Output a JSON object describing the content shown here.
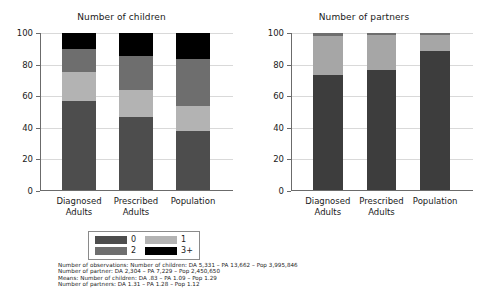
{
  "chart_data": [
    {
      "type": "bar",
      "stacked": true,
      "title": "Number of children",
      "xlabel": "",
      "ylabel": "",
      "ylim": [
        0,
        100
      ],
      "yticks": [
        0,
        20,
        40,
        60,
        80,
        100
      ],
      "grid": true,
      "legend_position": "bottom",
      "categories": [
        "Diagnosed Adults",
        "Prescribed Adults",
        "Population"
      ],
      "category_lines": [
        [
          "Diagnosed",
          "Adults"
        ],
        [
          "Prescribed",
          "Adults"
        ],
        [
          "Population",
          ""
        ]
      ],
      "series": [
        {
          "name": "0",
          "color": "#4d4d4d",
          "values": [
            56.5,
            46.5,
            37.5
          ]
        },
        {
          "name": "1",
          "color": "#b3b3b3",
          "values": [
            18.5,
            17.0,
            16.0
          ]
        },
        {
          "name": "2",
          "color": "#6e6e6e",
          "values": [
            15.0,
            22.0,
            30.0
          ]
        },
        {
          "name": "3+",
          "color": "#000000",
          "values": [
            10.0,
            14.5,
            16.5
          ]
        }
      ]
    },
    {
      "type": "bar",
      "stacked": true,
      "title": "Number of partners",
      "xlabel": "",
      "ylabel": "",
      "ylim": [
        0,
        100
      ],
      "yticks": [
        0,
        20,
        40,
        60,
        80,
        100
      ],
      "grid": true,
      "legend_position": "bottom",
      "categories": [
        "Diagnosed Adults",
        "Prescribed Adults",
        "Population"
      ],
      "category_lines": [
        [
          "Diagnosed",
          "Adults"
        ],
        [
          "Prescribed",
          "Adults"
        ],
        [
          "Population",
          ""
        ]
      ],
      "series": [
        {
          "name": "1",
          "color": "#3d3d3d",
          "values": [
            73.5,
            76.5,
            88.5
          ]
        },
        {
          "name": "2",
          "color": "#a6a6a6",
          "values": [
            24.5,
            22.0,
            10.5
          ]
        },
        {
          "name": "3+",
          "color": "#6e6e6e",
          "values": [
            2.0,
            1.5,
            1.0
          ]
        }
      ]
    }
  ],
  "left_chart": {
    "title": "Number of children",
    "yticks": [
      "100",
      "80",
      "60",
      "40",
      "20",
      "0"
    ],
    "xticks": [
      {
        "line1": "Diagnosed",
        "line2": "Adults"
      },
      {
        "line1": "Prescribed",
        "line2": "Adults"
      },
      {
        "line1": "Population",
        "line2": ""
      }
    ],
    "legend": [
      {
        "label": "0",
        "color": "#4d4d4d"
      },
      {
        "label": "1",
        "color": "#b3b3b3"
      },
      {
        "label": "2",
        "color": "#6e6e6e"
      },
      {
        "label": "3+",
        "color": "#000000"
      }
    ]
  },
  "right_chart": {
    "title": "Number of partners",
    "yticks": [
      "100",
      "80",
      "60",
      "40",
      "20",
      "0"
    ],
    "xticks": [
      {
        "line1": "Diagnosed",
        "line2": "Adults"
      },
      {
        "line1": "Prescribed",
        "line2": "Adults"
      },
      {
        "line1": "Population",
        "line2": ""
      }
    ],
    "legend": [
      {
        "label": "1",
        "color": "#3d3d3d"
      },
      {
        "label": "2",
        "color": "#a6a6a6"
      },
      {
        "label": "3+",
        "color": "#6e6e6e"
      }
    ]
  },
  "footnote": {
    "line1": "Number of observations: Number of children: DA 5,331 – PA 13,662 – Pop 3,995,846",
    "line2": "Number of partner: DA 2,304 – PA 7,229 – Pop 2,450,650",
    "line3": "Means: Number of children: DA .83 – PA 1.09 – Pop 1.29",
    "line4": "Number of partners: DA 1.31 – PA 1.28 – Pop 1.12"
  }
}
